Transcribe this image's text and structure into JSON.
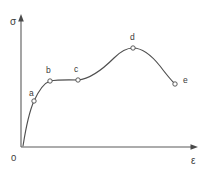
{
  "figure": {
    "background_color": "#ffffff",
    "line_color": "#4f4f4f",
    "axis_color": "#5a5a5a",
    "width": 208,
    "height": 169
  },
  "axes": {
    "y_axis_label": "σ",
    "x_axis_label": "ε",
    "origin_label": "0"
  },
  "chart_data": {
    "type": "line",
    "title": "",
    "subtitle": "",
    "xlabel": "ε",
    "ylabel": "σ",
    "xlim": [
      0,
      100
    ],
    "ylim": [
      0,
      100
    ],
    "grid": false,
    "legend": null,
    "tick_labels": {
      "x": [],
      "y": []
    },
    "series": [
      {
        "name": "stress-strain curve",
        "x": [
          0,
          4,
          7,
          12,
          16,
          23,
          32,
          40,
          48,
          56,
          64,
          72,
          80,
          88,
          95,
          100
        ],
        "y": [
          0,
          26,
          41,
          52,
          57,
          58,
          60,
          65,
          72,
          80,
          86,
          88,
          86,
          80,
          72,
          64
        ]
      }
    ],
    "annotations": [
      {
        "label": "a",
        "x": 7,
        "y": 35,
        "px": 34,
        "py": 101,
        "label_px": 29,
        "label_py": 96
      },
      {
        "label": "b",
        "x": 17,
        "y": 49,
        "px": 50,
        "py": 81,
        "label_px": 46,
        "label_py": 73
      },
      {
        "label": "c",
        "x": 33,
        "y": 50,
        "px": 78,
        "py": 80,
        "label_px": 74,
        "label_py": 72
      },
      {
        "label": "d",
        "x": 64,
        "y": 75,
        "px": 133,
        "py": 48,
        "label_px": 130,
        "label_py": 40
      },
      {
        "label": "e",
        "x": 88,
        "y": 48,
        "px": 175,
        "py": 84,
        "label_px": 183,
        "label_py": 83
      }
    ],
    "marker_radius_px": 2.2,
    "curve_path": "M 23 146 C 26 127, 29 112, 34 101 C 39 90, 44 83, 50 81 C 58 79.6, 70 79.8, 78 80 C 90 79, 104 68, 114 58 C 121 51, 127 48, 133 48 C 142 48, 152 56, 160 66 C 166 74, 171 80, 175 84"
  },
  "geometry": {
    "y_axis": {
      "x": 21,
      "y_top": 18,
      "y_bottom": 147
    },
    "x_axis": {
      "y": 147,
      "x_left": 21,
      "x_right": 194
    },
    "y_arrow": "21,14 18,21 24,21",
    "x_arrow": "198,147 191,144 191,150",
    "y_label_pos": {
      "x": 10,
      "y": 24
    },
    "x_label_pos": {
      "x": 192,
      "y": 163
    },
    "origin_label_pos": {
      "x": 12,
      "y": 160
    }
  }
}
